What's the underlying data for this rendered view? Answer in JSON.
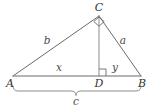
{
  "figure": {
    "type": "geometry-diagram",
    "stroke_color": "#6a6a6a",
    "label_color": "#3b3b3b",
    "background": "#ffffff",
    "vertices": [
      {
        "id": "A",
        "label": "A",
        "x": 13,
        "y": 76,
        "label_x": 10,
        "label_y": 83
      },
      {
        "id": "C",
        "label": "C",
        "x": 99,
        "y": 16,
        "label_x": 99,
        "label_y": 7
      },
      {
        "id": "B",
        "label": "B",
        "x": 141,
        "y": 76,
        "label_x": 142,
        "label_y": 83
      },
      {
        "id": "D",
        "label": "D",
        "x": 99,
        "y": 76,
        "label_x": 99,
        "label_y": 83
      }
    ],
    "segments": [
      {
        "id": "AC",
        "label": "b",
        "from": "A",
        "to": "C",
        "label_x": 47,
        "label_y": 40
      },
      {
        "id": "CB",
        "label": "a",
        "from": "C",
        "to": "B",
        "label_x": 123,
        "label_y": 40
      },
      {
        "id": "AD",
        "label": "x",
        "from": "A",
        "to": "D",
        "label_x": 59,
        "label_y": 67
      },
      {
        "id": "DB",
        "label": "y",
        "from": "D",
        "to": "B",
        "label_x": 115,
        "label_y": 67
      },
      {
        "id": "CD",
        "label": "",
        "from": "C",
        "to": "D",
        "label_x": 0,
        "label_y": 0
      },
      {
        "id": "AB",
        "label": "c",
        "from": "A",
        "to": "B",
        "label_x": 76,
        "label_y": 101
      }
    ],
    "right_angles": [
      {
        "at": "C",
        "style": "rotated-square",
        "size": 7
      },
      {
        "at": "D",
        "style": "square",
        "size": 7
      }
    ],
    "brace": {
      "label": "c",
      "from_x": 13,
      "to_x": 141,
      "y": 86,
      "label_x": 76,
      "label_y": 101
    }
  }
}
